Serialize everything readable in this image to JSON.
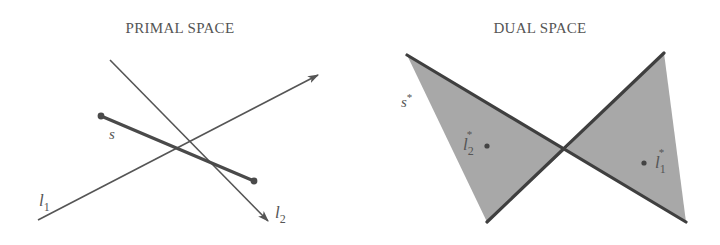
{
  "primal": {
    "title": "PRIMAL SPACE",
    "labels": {
      "segment": "s",
      "line1": "l",
      "line1_sub": "1",
      "line2": "l",
      "line2_sub": "2"
    }
  },
  "dual": {
    "title": "DUAL SPACE",
    "labels": {
      "segment_dual": "s",
      "segment_dual_sup": "*",
      "point1": "l",
      "point1_sub": "1",
      "point1_sup": "*",
      "point2": "l",
      "point2_sub": "2",
      "point2_sup": "*"
    }
  },
  "colors": {
    "line": "#555555",
    "segment": "#4a4a4a",
    "fill": "#a8a8a8",
    "edge": "#3f3f3f",
    "text": "#555555"
  }
}
